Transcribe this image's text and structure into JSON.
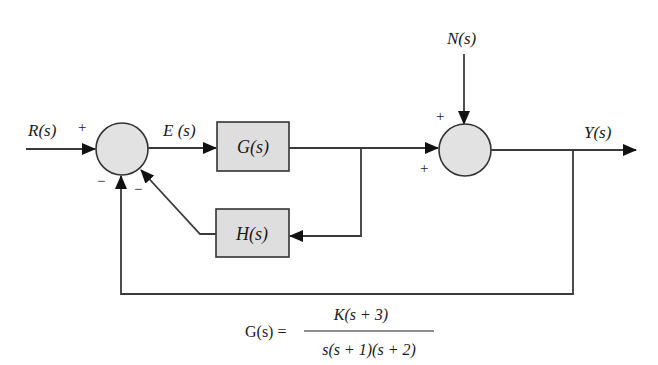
{
  "diagram": {
    "type": "control-system-block-diagram",
    "colors": {
      "block_fill": "#dedede",
      "summing_fill": "#e2e2e2",
      "stroke": "#333333",
      "text": "#1a1a1a"
    },
    "signals": {
      "input": "R(s)",
      "error": "E (s)",
      "disturbance": "N(s)",
      "output": "Y(s)"
    },
    "blocks": {
      "forward": "G(s)",
      "feedback": "H(s)"
    },
    "summing_junction_1": {
      "signs": {
        "input": "+",
        "outer_feedback": "−",
        "inner_feedback": "−"
      }
    },
    "summing_junction_2": {
      "signs": {
        "disturbance": "+",
        "forward": "+"
      }
    },
    "equation": {
      "lhs": "G(s) =",
      "numerator": "K(s  +  3)",
      "denominator": "s(s  +  1)(s  +  2)"
    }
  }
}
